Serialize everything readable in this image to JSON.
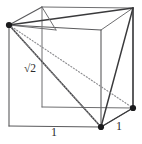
{
  "figure": {
    "name": "Cube with inscribed regular tetrahedron",
    "type": "geometric-diagram",
    "background_color": "#ffffff",
    "colors": {
      "cube_edge": "#5a5a5c",
      "cube_edge_light": "#6e6e70",
      "tetrahedron_edge": "#3a3a3c",
      "hidden_edge": "#8d8d90",
      "vertex_dot": "#1b1b1d",
      "label_text": "#2b2b2d"
    },
    "labels": {
      "face_diagonal": "√2",
      "bottom_edge": "1",
      "right_edge": "1"
    },
    "vertices": {
      "front_top_left": [
        9,
        25
      ],
      "front_top_right": [
        101,
        30
      ],
      "front_bottom_left": [
        9,
        126
      ],
      "front_bottom_right": [
        101,
        127
      ],
      "back_top_left": [
        42,
        7
      ],
      "back_top_right": [
        133,
        8
      ],
      "back_bottom_left": [
        42,
        107
      ],
      "back_bottom_right": [
        133,
        108
      ]
    },
    "marked_vertices": [
      "front_top_left",
      "front_bottom_right",
      "back_top_right",
      "back_bottom_right"
    ],
    "tetrahedron_edges": [
      [
        "front_top_left",
        "front_bottom_right"
      ],
      [
        "front_top_left",
        "back_top_right"
      ],
      [
        "front_top_left",
        "back_bottom_right"
      ],
      [
        "front_bottom_right",
        "back_top_right"
      ],
      [
        "front_bottom_right",
        "back_bottom_right"
      ],
      [
        "back_top_right",
        "back_bottom_right"
      ]
    ],
    "hidden_tetrahedron_edges": [
      [
        "front_top_left",
        "back_bottom_right"
      ]
    ]
  }
}
